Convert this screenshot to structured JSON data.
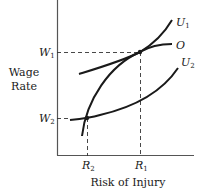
{
  "diagram": {
    "type": "compensating-wage-differential",
    "y_axis_label_line1": "Wage",
    "y_axis_label_line2": "Rate",
    "x_axis_label": "Risk of Injury",
    "y_ticks": [
      {
        "base": "W",
        "sub": "1"
      },
      {
        "base": "W",
        "sub": "2"
      }
    ],
    "x_ticks": [
      {
        "base": "R",
        "sub": "2"
      },
      {
        "base": "R",
        "sub": "1"
      }
    ],
    "curves": [
      {
        "base": "U",
        "sub": "1"
      },
      {
        "base": "O",
        "sub": ""
      },
      {
        "base": "U",
        "sub": "2"
      }
    ],
    "colors": {
      "line": "#1a1a1a",
      "background": "#ffffff"
    }
  }
}
